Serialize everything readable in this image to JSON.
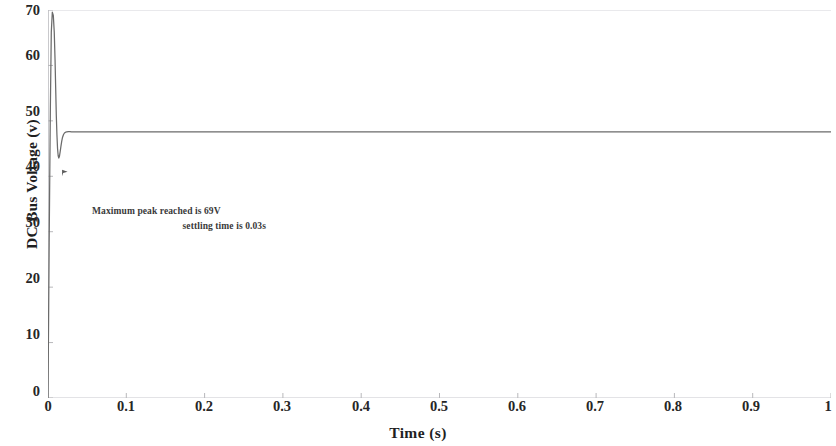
{
  "chart_data": {
    "type": "line",
    "title": "",
    "xlabel": "Time (s)",
    "ylabel": "DC Bus Voltage (v)",
    "xlim": [
      0,
      1
    ],
    "ylim": [
      0,
      70
    ],
    "grid": false,
    "legend": null,
    "xticks": [
      "0",
      "0.1",
      "0.2",
      "0.3",
      "0.4",
      "0.5",
      "0.6",
      "0.7",
      "0.8",
      "0.9",
      "1"
    ],
    "xtick_values": [
      0,
      0.1,
      0.2,
      0.3,
      0.4,
      0.5,
      0.6,
      0.7,
      0.8,
      0.9,
      1
    ],
    "yticks": [
      "0",
      "10",
      "20",
      "30",
      "40",
      "50",
      "60",
      "70"
    ],
    "ytick_values": [
      0,
      10,
      20,
      30,
      40,
      50,
      60,
      70
    ],
    "line_color": "#6b6b6b",
    "series": [
      {
        "name": "DC Bus Voltage",
        "x": [
          0,
          0.0015,
          0.003,
          0.0042,
          0.0055,
          0.0068,
          0.008,
          0.009,
          0.0098,
          0.0106,
          0.0114,
          0.0122,
          0.013,
          0.0138,
          0.0146,
          0.0155,
          0.0165,
          0.0175,
          0.0185,
          0.0197,
          0.021,
          0.0225,
          0.024,
          0.026,
          0.028,
          0.03,
          0.033,
          0.036,
          0.04,
          0.05,
          0.07,
          0.1,
          0.15,
          0.2,
          0.3,
          0.4,
          0.5,
          0.6,
          0.7,
          0.8,
          0.9,
          1.0
        ],
        "y": [
          0,
          28,
          52,
          66,
          69.6,
          69.0,
          66.0,
          61.0,
          56.0,
          51.0,
          47.5,
          45.0,
          43.7,
          43.3,
          43.6,
          44.4,
          45.4,
          46.3,
          47.0,
          47.5,
          47.8,
          47.95,
          48.0,
          48.05,
          48.05,
          48.0,
          48.0,
          48.0,
          48.0,
          48.0,
          48.0,
          48.0,
          48.0,
          48.0,
          48.0,
          48.0,
          48.0,
          48.0,
          48.0,
          48.0,
          48.0,
          48.0
        ]
      }
    ],
    "annotations": [
      {
        "text": "Maximum peak reached is 69V"
      },
      {
        "text": "settling time is 0.03s"
      }
    ],
    "marker": {
      "name": "dip-arrow-marker",
      "x": 0.018,
      "y": 41.2
    }
  }
}
